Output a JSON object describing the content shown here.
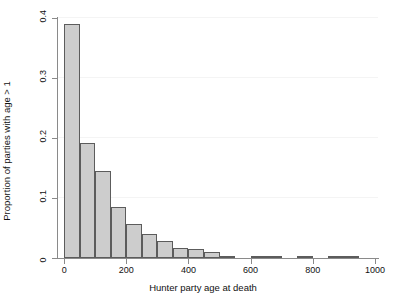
{
  "chart_data": {
    "type": "bar",
    "title": "",
    "subtitle": "",
    "xlabel": "Hunter party age at death",
    "ylabel": "Proportion of parties with age > 1",
    "xlim": [
      -20,
      1010
    ],
    "ylim": [
      0,
      0.4
    ],
    "bin_width": 50,
    "grid": true,
    "legend": null,
    "xticks": [
      0,
      200,
      400,
      600,
      800,
      1000
    ],
    "xtick_labels": [
      "0",
      "200",
      "400",
      "600",
      "800",
      "1000"
    ],
    "yticks": [
      0,
      0.1,
      0.2,
      0.3,
      0.4
    ],
    "ytick_labels": [
      "0",
      "0.1",
      "0.2",
      "0.3",
      "0.4"
    ],
    "bin_starts": [
      0,
      50,
      100,
      150,
      200,
      250,
      300,
      350,
      400,
      450,
      500,
      550,
      600,
      650,
      700,
      750,
      800,
      850,
      900
    ],
    "values": [
      0.39,
      0.192,
      0.145,
      0.085,
      0.057,
      0.04,
      0.029,
      0.017,
      0.015,
      0.01,
      0.001,
      0.0,
      0.002,
      0.001,
      0.0,
      0.002,
      0.0,
      0.001,
      0.002
    ],
    "colors": {
      "bar_fill": "#cdcdcd",
      "bar_border": "#5c5c5c",
      "axis": "#8a8a8a",
      "gridline": "#f4f4f4",
      "text": "#111111",
      "background": "#ffffff"
    }
  }
}
